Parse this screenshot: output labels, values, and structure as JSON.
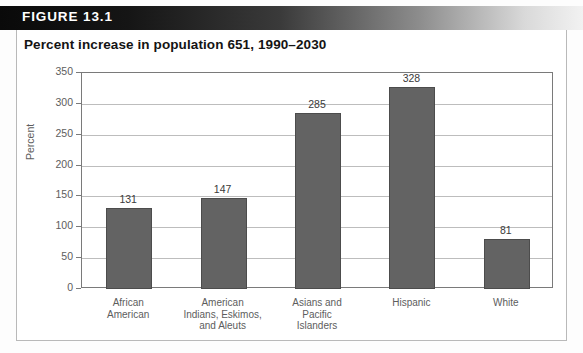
{
  "figure": {
    "label": "FIGURE 13.1",
    "title": "Percent increase in population 651, 1990–2030"
  },
  "colors": {
    "bar_fill": "#636363",
    "bar_stroke": "#4c4c4c",
    "gridline": "#bdbdbd",
    "axis": "#7a7a7a",
    "tick_text": "#5d5d5d",
    "header_dark": "#0a0a0a",
    "header_light": "#f2f2f2",
    "title_text": "#141414",
    "panel_border": "#b9b9b9",
    "background": "#ffffff"
  },
  "chart_data": {
    "type": "bar",
    "title": "Percent increase in population 651, 1990–2030",
    "xlabel": "",
    "ylabel": "Percent",
    "ylim": [
      0,
      350
    ],
    "yticks": [
      0,
      50,
      100,
      150,
      200,
      250,
      300,
      350
    ],
    "ytick_labels": [
      "0",
      "50",
      "100",
      "150",
      "200",
      "250",
      "300",
      "350"
    ],
    "grid": true,
    "legend": false,
    "categories": [
      "African American",
      "American Indians, Eskimos, and Aleuts",
      "Asians and Pacific Islanders",
      "Hispanic",
      "White"
    ],
    "category_lines": [
      [
        "African",
        "American"
      ],
      [
        "American",
        "Indians, Eskimos,",
        "and Aleuts"
      ],
      [
        "Asians and",
        "Pacific",
        "Islanders"
      ],
      [
        "Hispanic"
      ],
      [
        "White"
      ]
    ],
    "values": [
      131,
      147,
      285,
      328,
      81
    ],
    "value_labels": [
      "131",
      "147",
      "285",
      "328",
      "81"
    ]
  }
}
